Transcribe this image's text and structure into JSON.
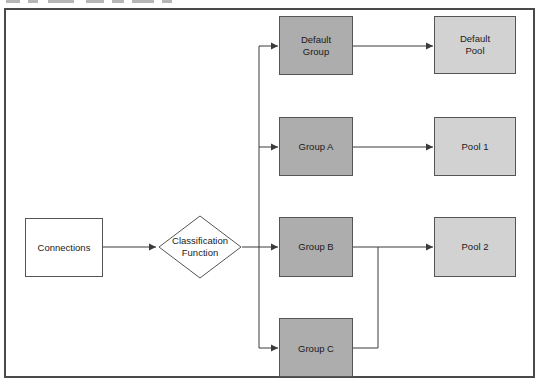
{
  "diagram": {
    "type": "flowchart",
    "colors": {
      "group_fill": "#adadad",
      "pool_fill": "#d2d2d2",
      "plain_fill": "#ffffff",
      "stroke": "#3b3b3b",
      "frame_stroke": "#4a4a4a",
      "text": "#1a1a1a"
    },
    "nodes": [
      {
        "id": "connections",
        "label": "Connections",
        "shape": "rect",
        "style": "plain"
      },
      {
        "id": "classification-function",
        "label": "Classification\nFunction",
        "line1": "Classification",
        "line2": "Function",
        "shape": "diamond",
        "style": "plain"
      },
      {
        "id": "default-group",
        "label": "Default Group",
        "line1": "Default",
        "line2": "Group",
        "shape": "rect",
        "style": "group"
      },
      {
        "id": "group-a",
        "label": "Group A",
        "shape": "rect",
        "style": "group"
      },
      {
        "id": "group-b",
        "label": "Group B",
        "shape": "rect",
        "style": "group"
      },
      {
        "id": "group-c",
        "label": "Group C",
        "shape": "rect",
        "style": "group"
      },
      {
        "id": "default-pool",
        "label": "Default Pool",
        "line1": "Default",
        "line2": "Pool",
        "shape": "rect",
        "style": "pool"
      },
      {
        "id": "pool-1",
        "label": "Pool 1",
        "shape": "rect",
        "style": "pool"
      },
      {
        "id": "pool-2",
        "label": "Pool 2",
        "shape": "rect",
        "style": "pool"
      }
    ],
    "edges": [
      {
        "from": "connections",
        "to": "classification-function"
      },
      {
        "from": "classification-function",
        "to": "default-group"
      },
      {
        "from": "classification-function",
        "to": "group-a"
      },
      {
        "from": "classification-function",
        "to": "group-b"
      },
      {
        "from": "classification-function",
        "to": "group-c"
      },
      {
        "from": "default-group",
        "to": "default-pool"
      },
      {
        "from": "group-a",
        "to": "pool-1"
      },
      {
        "from": "group-b",
        "to": "pool-2"
      },
      {
        "from": "group-c",
        "to": "pool-2"
      }
    ]
  }
}
